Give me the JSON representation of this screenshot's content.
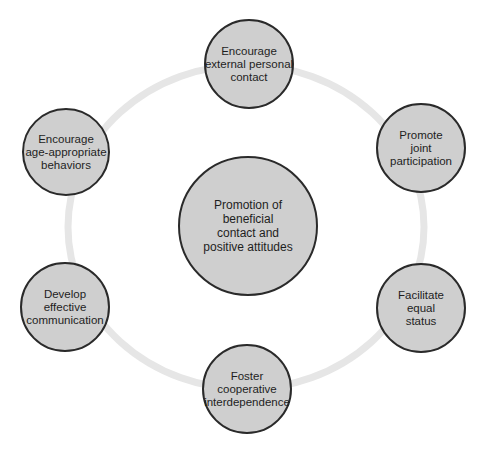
{
  "diagram": {
    "type": "hub-and-ring",
    "colors": {
      "background": "#ffffff",
      "node_fill": "#cfcfcf",
      "node_border": "#2a2a2a",
      "ring": "#e6e6e6",
      "text": "#1e1e1e"
    },
    "ring": {
      "cx": 246,
      "cy": 227,
      "rx": 178,
      "ry": 162,
      "stroke_width": 7
    },
    "center": {
      "lines": [
        "Promotion of",
        "beneficial",
        "contact and",
        "positive attitudes"
      ],
      "cx": 248,
      "cy": 226,
      "r": 70
    },
    "nodes": [
      {
        "id": "top",
        "lines": [
          "Encourage",
          "external personal",
          "contact"
        ],
        "cx": 249,
        "cy": 64,
        "r": 45
      },
      {
        "id": "upper-right",
        "lines": [
          "Promote",
          "joint",
          "participation"
        ],
        "cx": 421,
        "cy": 148,
        "r": 45
      },
      {
        "id": "lower-right",
        "lines": [
          "Facilitate",
          "equal",
          "status"
        ],
        "cx": 421,
        "cy": 308,
        "r": 45
      },
      {
        "id": "bottom",
        "lines": [
          "Foster",
          "cooperative",
          "interdependence"
        ],
        "cx": 247,
        "cy": 389,
        "r": 45
      },
      {
        "id": "lower-left",
        "lines": [
          "Develop",
          "effective",
          "communication"
        ],
        "cx": 65,
        "cy": 307,
        "r": 45
      },
      {
        "id": "upper-left",
        "lines": [
          "Encourage",
          "age-appropriate",
          "behaviors"
        ],
        "cx": 66,
        "cy": 152,
        "r": 44
      }
    ]
  }
}
